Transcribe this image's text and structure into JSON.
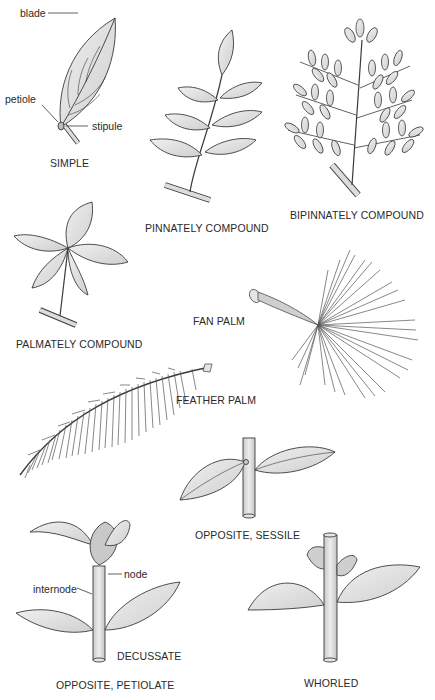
{
  "diagram": {
    "colors": {
      "leaf_fill": "#d6d6d6",
      "leaf_light": "#ececec",
      "outline": "#3a3a3a",
      "stem_fill": "#dcdcdc"
    },
    "panels": [
      {
        "id": "simple",
        "label": "SIMPLE",
        "parts": [
          "blade",
          "petiole",
          "stipule"
        ]
      },
      {
        "id": "pinnately",
        "label": "PINNATELY COMPOUND"
      },
      {
        "id": "bipinnately",
        "label": "BIPINNATELY COMPOUND"
      },
      {
        "id": "palmately",
        "label": "PALMATELY COMPOUND"
      },
      {
        "id": "fan-palm",
        "label": "FAN PALM"
      },
      {
        "id": "feather-palm",
        "label": "FEATHER PALM"
      },
      {
        "id": "opposite-sessile",
        "label": "OPPOSITE, SESSILE"
      },
      {
        "id": "opposite-petiolate",
        "label": "OPPOSITE, PETIOLATE",
        "parts": [
          "node",
          "internode"
        ],
        "sublabel": "DECUSSATE"
      },
      {
        "id": "whorled",
        "label": "WHORLED"
      }
    ]
  }
}
